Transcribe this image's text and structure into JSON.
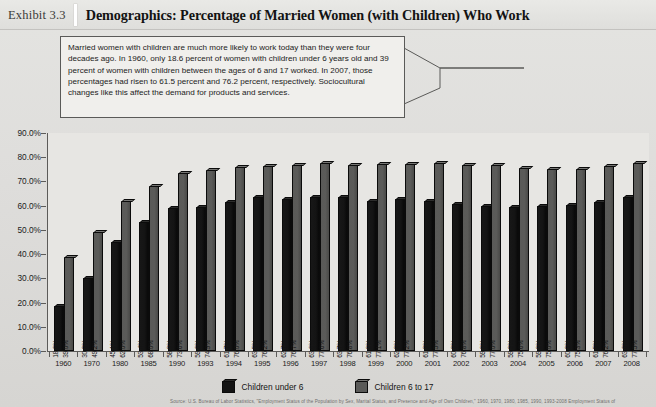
{
  "header": {
    "exhibit_number": "Exhibit 3.3",
    "title": "Demographics: Percentage of Married Women (with Children) Who Work"
  },
  "callout": {
    "text": "Married women with children are much more likely to work today than they were four decades ago. In 1960, only 18.6 percent of women with children under 6 years old and 39 percent of women with children between the ages of 6 and 17 worked. In 2007, those percentages had risen to 61.5 percent and 76.2 percent, respectively. Sociocultural changes like this affect the demand for products and services."
  },
  "source_note": {
    "text": "Source: U.S. Bureau of Labor Statistics, \"Employment Status of the Population by Sex, Marital Status, and Presence and Age of Own Children,\" 1960, 1970, 1980, 1985, 1990, 1993-2008 Employment Status of"
  },
  "colors": {
    "under6": "#141414",
    "six17": "#5a5a58",
    "plot_background": "#e7e6e3",
    "axis": "#5c5b59",
    "panel": "#dedddb"
  },
  "chart_data": {
    "type": "bar",
    "title": "Demographics: Percentage of Married Women (with Children) Who Work",
    "xlabel": "",
    "ylabel": "",
    "ylim": [
      0,
      90
    ],
    "grid": false,
    "legend_position": "bottom",
    "ytick_labels": [
      "90.0%",
      "80.0%",
      "70.0%",
      "60.0%",
      "50.0%",
      "40.0%",
      "30.0%",
      "20.0%",
      "10.0%",
      "0.0%"
    ],
    "ytick_values": [
      90,
      80,
      70,
      60,
      50,
      40,
      30,
      20,
      10,
      0
    ],
    "categories": [
      "1960",
      "1970",
      "1980",
      "1985",
      "1990",
      "1993",
      "1994",
      "1995",
      "1996",
      "1997",
      "1998",
      "1999",
      "2000",
      "2001",
      "2002",
      "2003",
      "2004",
      "2005",
      "2006",
      "2007",
      "2008"
    ],
    "series": [
      {
        "name": "Children under 6",
        "color": "#141414",
        "values": [
          18.6,
          30.3,
          45.1,
          53.4,
          58.9,
          59.6,
          61.7,
          63.5,
          62.7,
          63.6,
          63.7,
          61.8,
          62.8,
          61.9,
          60.8,
          59.8,
          59.3,
          59.8,
          60.3,
          61.5,
          63.6
        ],
        "labels": [
          "18.6%",
          "30.3%",
          "45.1%",
          "53.4%",
          "58.9%",
          "59.6%",
          "61.7%",
          "63.5%",
          "62.7%",
          "63.6%",
          "63.7%",
          "61.8%",
          "62.8%",
          "61.9%",
          "60.8%",
          "59.8%",
          "59.3%",
          "59.8%",
          "60.3%",
          "61.5%",
          "63.6%"
        ]
      },
      {
        "name": "Children 6 to 17",
        "color": "#5a5a58",
        "values": [
          39.0,
          49.2,
          62.0,
          68.0,
          73.6,
          74.9,
          76.0,
          76.2,
          76.7,
          77.6,
          76.8,
          77.1,
          77.2,
          77.5,
          76.8,
          77.0,
          75.6,
          75.0,
          75.3,
          76.2,
          77.5
        ],
        "labels": [
          "39.0%",
          "49.2%",
          "62.0%",
          "68.0%",
          "73.6%",
          "74.9%",
          "76.0%",
          "76.2%",
          "76.7%",
          "77.6%",
          "76.8%",
          "77.1%",
          "77.2%",
          "77.5%",
          "76.8%",
          "77.0%",
          "75.6%",
          "75.0%",
          "75.3%",
          "76.2%",
          "77.5%"
        ]
      }
    ]
  }
}
